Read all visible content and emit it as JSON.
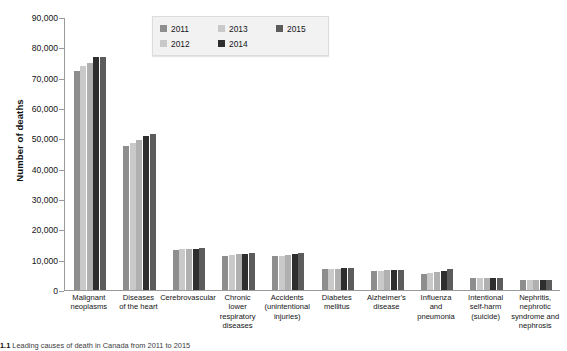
{
  "chart_data": {
    "type": "bar",
    "title": "",
    "xlabel": "",
    "ylabel": "Number of deaths",
    "ylim": [
      0,
      90000
    ],
    "ytick_step": 10000,
    "ytick_labels": [
      "0",
      "10,000",
      "20,000",
      "30,000",
      "40,000",
      "50,000",
      "60,000",
      "70,000",
      "80,000",
      "90,000"
    ],
    "ytick_values": [
      0,
      10000,
      20000,
      30000,
      40000,
      50000,
      60000,
      70000,
      80000,
      90000
    ],
    "grid": false,
    "legend_position": "top-center",
    "categories": [
      "Malignant neoplasms",
      "Diseases of the heart",
      "Cerebrovascular",
      "Chronic lower respiratory diseases",
      "Accidents (unintentional injuries)",
      "Diabetes mellitus",
      "Alzheimer's disease",
      "Influenza and pneumonia",
      "Intentional self-harm (suicide)",
      "Nephritis, nephrotic syndrome and nephrosis"
    ],
    "category_label_lines": [
      [
        "Malignant",
        "neoplasms"
      ],
      [
        "Diseases",
        "of the heart"
      ],
      [
        "Cerebrovascular"
      ],
      [
        "Chronic",
        "lower",
        "respiratory",
        "diseases"
      ],
      [
        "Accidents",
        "(unintentional",
        "injuries)"
      ],
      [
        "Diabetes",
        "mellitus"
      ],
      [
        "Alzheimer's",
        "disease"
      ],
      [
        "Influenza",
        "and",
        "pneumonia"
      ],
      [
        "Intentional",
        "self-harm",
        "(suicide)"
      ],
      [
        "Nephritis,",
        "nephrotic",
        "syndrome and",
        "nephrosis"
      ]
    ],
    "series": [
      {
        "name": "2011",
        "color": "#8e8e8e",
        "values": [
          72500,
          47800,
          13300,
          11400,
          11200,
          6900,
          6300,
          5300,
          4000,
          3200
        ]
      },
      {
        "name": "2012",
        "color": "#c9c9c9",
        "values": [
          74100,
          48800,
          13500,
          11500,
          11300,
          7000,
          6400,
          5600,
          4000,
          3200
        ]
      },
      {
        "name": "2013",
        "color": "#b0b0b0",
        "values": [
          75100,
          49800,
          13600,
          11800,
          11600,
          7100,
          6500,
          5900,
          4000,
          3250
        ]
      },
      {
        "name": "2014",
        "color": "#2e2e2e",
        "values": [
          77000,
          50900,
          13500,
          11900,
          12000,
          7200,
          6600,
          6300,
          4050,
          3250
        ]
      },
      {
        "name": "2015",
        "color": "#5c5c5c",
        "values": [
          77100,
          51500,
          13800,
          12300,
          12200,
          7400,
          6700,
          7000,
          4100,
          3300
        ]
      }
    ]
  },
  "legend": {
    "items": [
      {
        "label": "2011",
        "color": "#8e8e8e"
      },
      {
        "label": "2013",
        "color": "#c9c9c9"
      },
      {
        "label": "2015",
        "color": "#5c5c5c"
      },
      {
        "label": "2012",
        "color": "#c9c9c9"
      },
      {
        "label": "2014",
        "color": "#2e2e2e"
      }
    ]
  },
  "caption": {
    "number": "1.1",
    "text": "Leading causes of death in Canada from 2011 to 2015"
  }
}
